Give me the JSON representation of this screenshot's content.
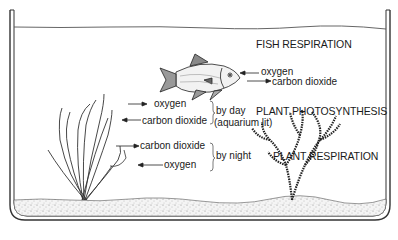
{
  "diagram": {
    "title_labels": {
      "fish_respiration": "FISH RESPIRATION",
      "plant_photosynthesis": "PLANT PHOTOSYNTHESIS",
      "plant_respiration": "PLANT RESPIRATION"
    },
    "fish_exchange": {
      "in": "oxygen",
      "out": "carbon dioxide"
    },
    "plant_day": {
      "out": "oxygen",
      "in": "carbon dioxide",
      "condition_line1": "by day",
      "condition_line2": "(aquarium lit)"
    },
    "plant_night": {
      "out": "carbon dioxide",
      "in": "oxygen",
      "condition": "by night"
    },
    "elements": [
      "aquarium-tank",
      "water-surface",
      "gravel-substrate",
      "fish",
      "grass-plant",
      "bushy-plant"
    ],
    "colors": {
      "ink": "#1a1a1a",
      "background": "#ffffff"
    }
  }
}
